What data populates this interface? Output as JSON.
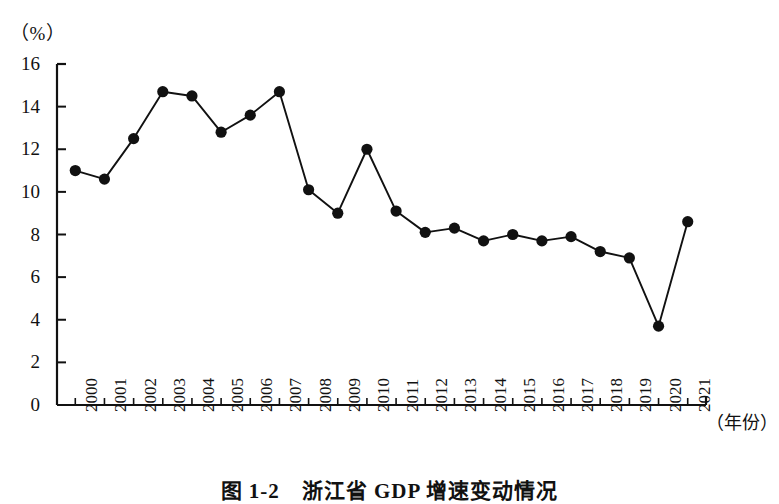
{
  "figure": {
    "unit_label": "（%）",
    "x_axis_title": "（年份）",
    "caption": "图 1-2　浙江省 GDP 增速变动情况"
  },
  "chart_data": {
    "type": "line",
    "title": "图 1-2　浙江省 GDP 增速变动情况",
    "xlabel": "（年份）",
    "ylabel": "（%）",
    "ylim": [
      0,
      16
    ],
    "ytick_labels": [
      "0",
      "2",
      "4",
      "6",
      "8",
      "10",
      "12",
      "14",
      "16"
    ],
    "ytick_values": [
      0,
      2,
      4,
      6,
      8,
      10,
      12,
      14,
      16
    ],
    "grid": false,
    "legend": "none",
    "marker": "filled-circle",
    "categories": [
      "2000",
      "2001",
      "2002",
      "2003",
      "2004",
      "2005",
      "2006",
      "2007",
      "2008",
      "2009",
      "2010",
      "2011",
      "2012",
      "2013",
      "2014",
      "2015",
      "2016",
      "2017",
      "2018",
      "2019",
      "2020",
      "2021"
    ],
    "values": [
      11.0,
      10.6,
      12.5,
      14.7,
      14.5,
      12.8,
      13.6,
      14.7,
      10.1,
      9.0,
      12.0,
      9.1,
      8.1,
      8.3,
      7.7,
      8.0,
      7.7,
      7.9,
      7.2,
      6.9,
      3.7,
      8.6
    ]
  }
}
